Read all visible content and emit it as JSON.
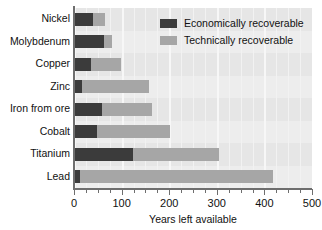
{
  "chart_data": {
    "type": "bar",
    "orientation": "horizontal",
    "stacked": false,
    "overlaid": true,
    "title": "",
    "xlabel": "Years left available",
    "ylabel": "",
    "xlim": [
      0,
      500
    ],
    "ylim": null,
    "grid": true,
    "grid_axis": "x",
    "legend_position": "top-right",
    "x_ticks_major": [
      0,
      100,
      200,
      300,
      400,
      500
    ],
    "x_tick_labels": [
      "0",
      "100",
      "200",
      "300",
      "400",
      "500"
    ],
    "x_tick_minor_step": 25,
    "categories": [
      "Nickel",
      "Molybdenum",
      "Copper",
      "Zinc",
      "Iron from ore",
      "Cobalt",
      "Titanium",
      "Lead"
    ],
    "series": [
      {
        "name": "Economically recoverable",
        "color": "#3b3b3b",
        "values": [
          40,
          63,
          36,
          17,
          59,
          48,
          124,
          13
        ]
      },
      {
        "name": "Technically recoverable",
        "color": "#a6a6a6",
        "values": [
          65,
          80,
          99,
          157,
          164,
          202,
          305,
          418
        ]
      }
    ]
  },
  "legend": {
    "entries": [
      {
        "label": "Economically recoverable",
        "swatch": "econ"
      },
      {
        "label": "Technically recoverable",
        "swatch": "tech"
      }
    ]
  },
  "colors": {
    "economically_recoverable": "#3b3b3b",
    "technically_recoverable": "#a6a6a6",
    "plot_background": "#e6e6e6",
    "gridline": "#f2f2f2",
    "axis": "#6e6e6e",
    "text": "#111111"
  }
}
